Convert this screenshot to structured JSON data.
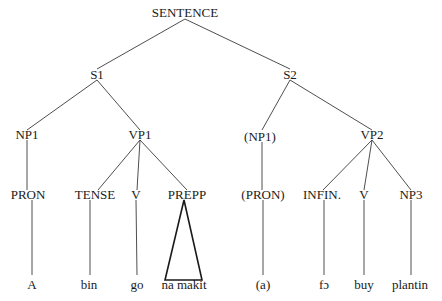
{
  "tree": {
    "root": "SENTENCE",
    "clauses": {
      "s1": "S1",
      "s2": "S2"
    },
    "phrases": {
      "np1": "NP1",
      "vp1": "VP1",
      "np1_opt": "(NP1)",
      "vp2": "VP2"
    },
    "categories": {
      "pron": "PRON",
      "tense": "TENSE",
      "v1": "V",
      "prepp": "PREPP",
      "pron_opt": "(PRON)",
      "infin": "INFIN.",
      "v2": "V",
      "np3": "NP3"
    },
    "leaves": {
      "a": "A",
      "bin": "bin",
      "go": "go",
      "na_makit": "na makit",
      "a_opt": "(a)",
      "fo": "fɔ",
      "buy": "buy",
      "plantin": "plantin"
    }
  }
}
